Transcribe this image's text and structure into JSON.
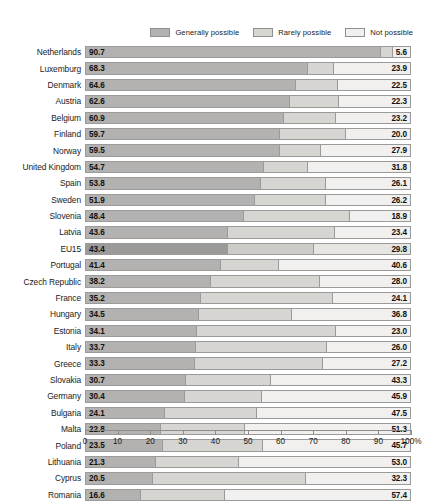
{
  "legend": {
    "items": [
      {
        "label": "Generally possible",
        "color": "#b3b2b0",
        "icon": "legend-swatch-icon"
      },
      {
        "label": "Rarely possible",
        "color": "#d6d5d2",
        "icon": "legend-swatch-icon"
      },
      {
        "label": "Not possible",
        "color": "#f1f0ee",
        "icon": "legend-swatch-icon"
      }
    ]
  },
  "axis": {
    "ticks": [
      "0",
      "10",
      "20",
      "30",
      "40",
      "50",
      "60",
      "70",
      "80",
      "90",
      "100%"
    ],
    "tick_values": [
      0,
      10,
      20,
      30,
      40,
      50,
      60,
      70,
      80,
      90,
      100
    ]
  },
  "chart_data": {
    "type": "bar",
    "orientation": "horizontal",
    "stacked": true,
    "title": "",
    "subtitle": "",
    "xlabel": "",
    "ylabel": "",
    "xlim": [
      0,
      100
    ],
    "grid": false,
    "legend_position": "top-right",
    "series": [
      {
        "name": "Generally possible",
        "color": "#b3b2b0",
        "values": [
          90.7,
          68.3,
          64.6,
          62.6,
          60.9,
          59.7,
          59.5,
          54.7,
          53.8,
          51.9,
          48.4,
          43.6,
          43.4,
          41.4,
          38.2,
          35.2,
          34.5,
          34.1,
          33.7,
          33.3,
          30.7,
          30.4,
          24.1,
          22.8,
          23.5,
          21.3,
          20.5,
          16.6
        ]
      },
      {
        "name": "Rarely possible",
        "color": "#d6d5d2",
        "values": [
          3.7,
          7.8,
          12.9,
          15.1,
          15.9,
          20.3,
          12.6,
          13.5,
          20.1,
          21.9,
          32.7,
          33.0,
          26.8,
          18.0,
          33.8,
          40.7,
          28.7,
          42.9,
          40.3,
          39.5,
          26.0,
          23.7,
          28.4,
          25.9,
          30.8,
          25.7,
          47.2,
          26.0
        ]
      },
      {
        "name": "Not possible",
        "color": "#f1f0ee",
        "values": [
          5.6,
          23.9,
          22.5,
          22.3,
          23.2,
          20.0,
          27.9,
          31.8,
          26.1,
          26.2,
          18.9,
          23.4,
          29.8,
          40.6,
          28.0,
          24.1,
          36.8,
          23.0,
          26.0,
          27.2,
          43.3,
          45.9,
          47.5,
          51.3,
          45.7,
          53.0,
          32.3,
          57.4
        ]
      }
    ],
    "categories": [
      "Netherlands",
      "Luxemburg",
      "Denmark",
      "Austria",
      "Belgium",
      "Finland",
      "Norway",
      "United Kingdom",
      "Spain",
      "Sweden",
      "Slovenia",
      "Latvia",
      "EU15",
      "Portugal",
      "Czech Republic",
      "France",
      "Hungary",
      "Estonia",
      "Italy",
      "Greece",
      "Slovakia",
      "Germany",
      "Bulgaria",
      "Malta",
      "Poland",
      "Lithuania",
      "Cyprus",
      "Romania"
    ]
  },
  "rows": [
    {
      "label": "Netherlands",
      "left": "90.7",
      "right": "5.6",
      "v1": 90.7,
      "v2": 3.7,
      "v3": 5.6,
      "highlight": false
    },
    {
      "label": "Luxemburg",
      "left": "68.3",
      "right": "23.9",
      "v1": 68.3,
      "v2": 7.8,
      "v3": 23.9,
      "highlight": false
    },
    {
      "label": "Denmark",
      "left": "64.6",
      "right": "22.5",
      "v1": 64.6,
      "v2": 12.9,
      "v3": 22.5,
      "highlight": false
    },
    {
      "label": "Austria",
      "left": "62.6",
      "right": "22.3",
      "v1": 62.6,
      "v2": 15.1,
      "v3": 22.3,
      "highlight": false
    },
    {
      "label": "Belgium",
      "left": "60.9",
      "right": "23.2",
      "v1": 60.9,
      "v2": 15.9,
      "v3": 23.2,
      "highlight": false
    },
    {
      "label": "Finland",
      "left": "59.7",
      "right": "20.0",
      "v1": 59.7,
      "v2": 20.3,
      "v3": 20.0,
      "highlight": false
    },
    {
      "label": "Norway",
      "left": "59.5",
      "right": "27.9",
      "v1": 59.5,
      "v2": 12.6,
      "v3": 27.9,
      "highlight": false
    },
    {
      "label": "United Kingdom",
      "left": "54.7",
      "right": "31.8",
      "v1": 54.7,
      "v2": 13.5,
      "v3": 31.8,
      "highlight": false
    },
    {
      "label": "Spain",
      "left": "53.8",
      "right": "26.1",
      "v1": 53.8,
      "v2": 20.1,
      "v3": 26.1,
      "highlight": false
    },
    {
      "label": "Sweden",
      "left": "51.9",
      "right": "26.2",
      "v1": 51.9,
      "v2": 21.9,
      "v3": 26.2,
      "highlight": false
    },
    {
      "label": "Slovenia",
      "left": "48.4",
      "right": "18.9",
      "v1": 48.4,
      "v2": 32.7,
      "v3": 18.9,
      "highlight": false
    },
    {
      "label": "Latvia",
      "left": "43.6",
      "right": "23.4",
      "v1": 43.6,
      "v2": 33.0,
      "v3": 23.4,
      "highlight": false
    },
    {
      "label": "EU15",
      "left": "43.4",
      "right": "29.8",
      "v1": 43.4,
      "v2": 26.8,
      "v3": 29.8,
      "highlight": true
    },
    {
      "label": "Portugal",
      "left": "41.4",
      "right": "40.6",
      "v1": 41.4,
      "v2": 18.0,
      "v3": 40.6,
      "highlight": false
    },
    {
      "label": "Czech Republic",
      "left": "38.2",
      "right": "28.0",
      "v1": 38.2,
      "v2": 33.8,
      "v3": 28.0,
      "highlight": false
    },
    {
      "label": "France",
      "left": "35.2",
      "right": "24.1",
      "v1": 35.2,
      "v2": 40.7,
      "v3": 24.1,
      "highlight": false
    },
    {
      "label": "Hungary",
      "left": "34.5",
      "right": "36.8",
      "v1": 34.5,
      "v2": 28.7,
      "v3": 36.8,
      "highlight": false
    },
    {
      "label": "Estonia",
      "left": "34.1",
      "right": "23.0",
      "v1": 34.1,
      "v2": 42.9,
      "v3": 23.0,
      "highlight": false
    },
    {
      "label": "Italy",
      "left": "33.7",
      "right": "26.0",
      "v1": 33.7,
      "v2": 40.3,
      "v3": 26.0,
      "highlight": false
    },
    {
      "label": "Greece",
      "left": "33.3",
      "right": "27.2",
      "v1": 33.3,
      "v2": 39.5,
      "v3": 27.2,
      "highlight": false
    },
    {
      "label": "Slovakia",
      "left": "30.7",
      "right": "43.3",
      "v1": 30.7,
      "v2": 26.0,
      "v3": 43.3,
      "highlight": false
    },
    {
      "label": "Germany",
      "left": "30.4",
      "right": "45.9",
      "v1": 30.4,
      "v2": 23.7,
      "v3": 45.9,
      "highlight": false
    },
    {
      "label": "Bulgaria",
      "left": "24.1",
      "right": "47.5",
      "v1": 24.1,
      "v2": 28.4,
      "v3": 47.5,
      "highlight": false
    },
    {
      "label": "Malta",
      "left": "22.8",
      "right": "51.3",
      "v1": 22.8,
      "v2": 25.9,
      "v3": 51.3,
      "highlight": false
    },
    {
      "label": "Poland",
      "left": "23.5",
      "right": "45.7",
      "v1": 23.5,
      "v2": 30.8,
      "v3": 45.7,
      "highlight": false
    },
    {
      "label": "Lithuania",
      "left": "21.3",
      "right": "53.0",
      "v1": 21.3,
      "v2": 25.7,
      "v3": 53.0,
      "highlight": false
    },
    {
      "label": "Cyprus",
      "left": "20.5",
      "right": "32.3",
      "v1": 20.5,
      "v2": 47.2,
      "v3": 32.3,
      "highlight": false
    },
    {
      "label": "Romania",
      "left": "16.6",
      "right": "57.4",
      "v1": 16.6,
      "v2": 26.0,
      "v3": 57.4,
      "highlight": false
    }
  ]
}
